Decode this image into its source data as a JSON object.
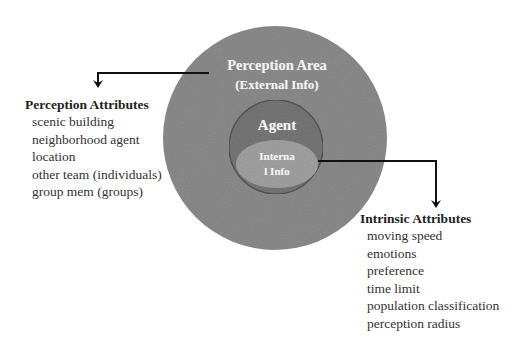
{
  "diagram": {
    "perception_area": {
      "title": "Perception Area",
      "subtitle": "(External Info)",
      "color": "#8c8c8c"
    },
    "agent": {
      "label": "Agent",
      "color": "#797979",
      "outline_color": "#5a5a5a"
    },
    "internal_info": {
      "line1": "Interna",
      "line2": "l Info",
      "color": "#a3a3a3"
    },
    "arrow_color": "#111111"
  },
  "perception_attributes": {
    "heading": "Perception Attributes",
    "items": [
      "scenic building",
      "neighborhood agent",
      "location",
      "other team (individuals)",
      "group mem (groups)"
    ]
  },
  "intrinsic_attributes": {
    "heading": "Intrinsic Attributes",
    "items": [
      "moving speed",
      "emotions",
      "preference",
      "time limit",
      "population classification",
      "perception radius"
    ]
  }
}
